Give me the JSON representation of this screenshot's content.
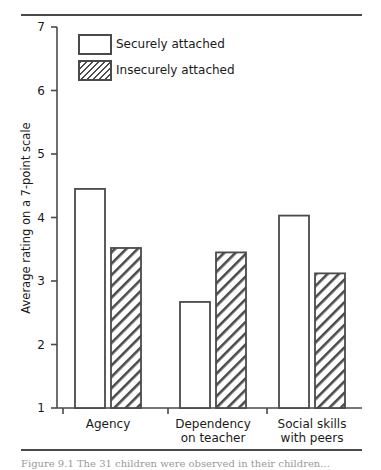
{
  "figure": {
    "top_rule": "rule-top",
    "bottom_rule": "rule-bottom",
    "caption": "Figure 9.1  The 31 children were observed in their children..."
  },
  "chart_data": {
    "type": "bar",
    "title": "",
    "subtitle": "",
    "xlabel": "",
    "ylabel": "Average rating on a 7-point scale",
    "ylim": [
      1,
      7
    ],
    "yticks": [
      1,
      2,
      3,
      4,
      5,
      6,
      7
    ],
    "ytick_labels": [
      "1",
      "2",
      "3",
      "4",
      "5",
      "6",
      "7"
    ],
    "grid": false,
    "legend_position": "upper-left-inside",
    "categories": [
      "Agency",
      "Dependency on teacher",
      "Social skills with peers"
    ],
    "category_lines": [
      [
        "Agency",
        ""
      ],
      [
        "Dependency",
        "on teacher"
      ],
      [
        "Social skills",
        "with peers"
      ]
    ],
    "series": [
      {
        "name": "Securely attached",
        "fill": "white",
        "values": [
          4.45,
          2.67,
          4.03
        ]
      },
      {
        "name": "Insecurely attached",
        "fill": "hatched",
        "values": [
          3.52,
          3.45,
          3.12
        ]
      }
    ]
  },
  "colors": {
    "line": "#4a4a4a",
    "bar_fill": "#ffffff",
    "hatch": "#4a4a4a",
    "text": "#1a1a1a"
  }
}
